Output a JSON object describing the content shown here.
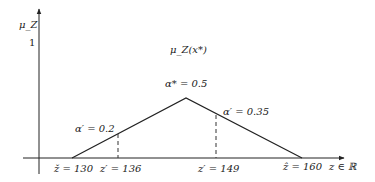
{
  "diagram": {
    "type": "triangular-fuzzy-membership-function",
    "y_axis_label": "μ_Z",
    "y_tick": "1",
    "function_label": "μ_Z(x*)",
    "x_axis_label": "z ∈ ℝ",
    "peak_label": "α* = 0.5",
    "alpha_left_label": "α′ = 0.2",
    "alpha_right_label": "α′ = 0.35",
    "x_labels": {
      "left_base": "ž = 130",
      "left_cut": "z′ = 136",
      "right_cut": "z′ = 149",
      "right_base": "ẑ = 160"
    },
    "points": {
      "left_base": {
        "z": 130,
        "mu": 0
      },
      "peak": {
        "mu": 0.5
      },
      "right_base": {
        "z": 160,
        "mu": 0
      },
      "left_cut": {
        "z": 136,
        "mu": 0.2
      },
      "right_cut": {
        "z": 149,
        "mu": 0.35
      }
    },
    "colors": {
      "line": "#222222"
    }
  }
}
